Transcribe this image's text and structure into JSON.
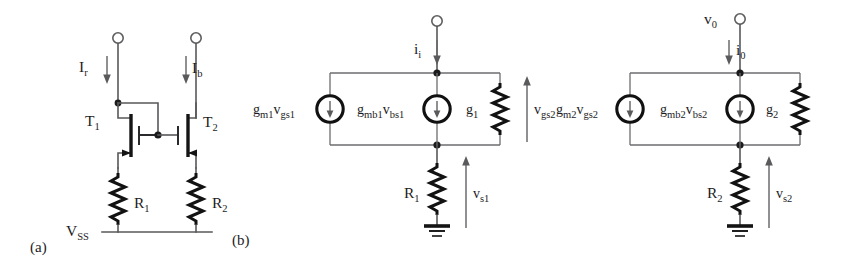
{
  "figure": {
    "background_color": "#ffffff",
    "ink_color": "#1c1c1e",
    "wire_color": "#58585a"
  },
  "panels": [
    {
      "id": "a",
      "label": "(a)",
      "caption": "MOS current mirror with source degeneration resistors"
    },
    {
      "id": "b",
      "label": "(b)",
      "caption": "Small-signal equivalent circuits"
    }
  ],
  "circuit_a": {
    "panel_label": "(a)",
    "rail_label": "V",
    "rail_label_sub": "SS",
    "currents": [
      {
        "name": "I",
        "sub": "r",
        "direction": "down"
      },
      {
        "name": "I",
        "sub": "b",
        "direction": "down"
      }
    ],
    "transistors": [
      {
        "name": "T",
        "sub": "1",
        "type": "nmos"
      },
      {
        "name": "T",
        "sub": "2",
        "type": "nmos"
      }
    ],
    "resistors": [
      {
        "name": "R",
        "sub": "1"
      },
      {
        "name": "R",
        "sub": "2"
      }
    ],
    "terminals": [
      {
        "name": "left-input-terminal"
      },
      {
        "name": "right-input-terminal"
      }
    ]
  },
  "circuit_b1": {
    "panel_label": "(b)",
    "input_current": {
      "name": "i",
      "sub": "i",
      "direction": "down"
    },
    "sources": [
      {
        "prefix": "g",
        "prefix_sub": "m1",
        "factor": "v",
        "factor_sub": "gs1",
        "direction": "down"
      },
      {
        "prefix": "g",
        "prefix_sub": "mb1",
        "factor": "v",
        "factor_sub": "bs1",
        "direction": "down"
      }
    ],
    "conductance": {
      "name": "g",
      "sub": "1"
    },
    "resistor": {
      "name": "R",
      "sub": "1"
    },
    "voltages": [
      {
        "name": "v",
        "sub": "gs2",
        "direction": "up"
      },
      {
        "name": "v",
        "sub": "s1",
        "direction": "up"
      }
    ],
    "ground": true
  },
  "circuit_b2": {
    "output_node": {
      "name": "v",
      "sub": "0"
    },
    "output_current": {
      "name": "i",
      "sub": "0",
      "direction": "down"
    },
    "sources": [
      {
        "prefix": "g",
        "prefix_sub": "m2",
        "factor": "v",
        "factor_sub": "gs2",
        "direction": "down"
      },
      {
        "prefix": "g",
        "prefix_sub": "mb2",
        "factor": "v",
        "factor_sub": "bs2",
        "direction": "down"
      }
    ],
    "conductance": {
      "name": "g",
      "sub": "2"
    },
    "resistor": {
      "name": "R",
      "sub": "2"
    },
    "voltages": [
      {
        "name": "v",
        "sub": "s2",
        "direction": "up"
      }
    ],
    "ground": true
  }
}
